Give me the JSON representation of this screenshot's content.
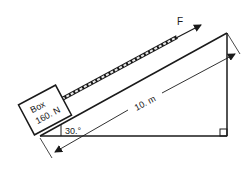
{
  "diagram": {
    "type": "inclined-plane-physics",
    "force_label": "F",
    "box": {
      "line1": "Box",
      "line2": "160. N"
    },
    "length_label": "10. m",
    "angle_label": "30.°",
    "right_angle_marker": true,
    "colors": {
      "stroke": "#1a1a1a",
      "background": "#ffffff",
      "rope_fill": "#e8e8e8"
    }
  }
}
